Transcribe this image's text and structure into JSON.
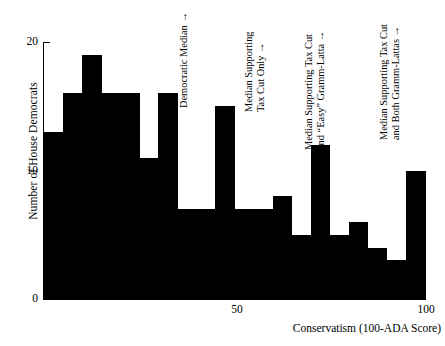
{
  "chart_data": {
    "type": "bar",
    "title": "",
    "subtitle": "",
    "xlabel": "Conservatism (100-ADA Score)",
    "ylabel": "Number of House Democrats",
    "xlim": [
      0,
      100
    ],
    "ylim": [
      0,
      20
    ],
    "grid": false,
    "legend": "none",
    "bar_style": "histogram (adjacent bins, solid black)",
    "xticks": [
      {
        "value": 50,
        "label": "50"
      },
      {
        "value": 100,
        "label": "100"
      }
    ],
    "yticks": [
      {
        "value": 0,
        "label": "0"
      },
      {
        "value": 10,
        "label": "10"
      },
      {
        "value": 20,
        "label": "20"
      }
    ],
    "bin_width": 5,
    "categories": [
      "0-5",
      "5-10",
      "10-15",
      "15-20",
      "20-25",
      "25-30",
      "30-35",
      "35-40",
      "40-45",
      "45-50",
      "50-55",
      "55-60",
      "60-65",
      "65-70",
      "70-75",
      "75-80",
      "80-85",
      "85-90",
      "90-95",
      "95-100"
    ],
    "bin_starts": [
      0,
      5,
      10,
      15,
      20,
      25,
      30,
      35,
      40,
      45,
      50,
      55,
      60,
      65,
      70,
      75,
      80,
      85,
      90,
      95
    ],
    "values": [
      13,
      16,
      19,
      16,
      16,
      11,
      16,
      7,
      7,
      15,
      7,
      7,
      8,
      5,
      12,
      5,
      6,
      4,
      3,
      10
    ],
    "annotations": [
      {
        "name": "democratic-median",
        "lines": [
          "Democratic Median →"
        ],
        "x_value": 33,
        "arrow": "→"
      },
      {
        "name": "median-supporting-tax-cut-only",
        "lines": [
          "Median Supporting",
          "Tax Cut Only →"
        ],
        "x_value": 52,
        "arrow": "→"
      },
      {
        "name": "median-supporting-tax-cut-and-easy-gramm-latta",
        "lines": [
          "Median Supporting Tax Cut",
          "and “Easy” Gramm-Latta →"
        ],
        "x_value": 67,
        "arrow": "→"
      },
      {
        "name": "median-supporting-tax-cut-and-both-gramm-lattas",
        "lines": [
          "Median Supporting Tax Cut",
          "and Both Gramm-Lattas →"
        ],
        "x_value": 86,
        "arrow": "→"
      }
    ],
    "colors": {
      "bar": "#000000",
      "axis": "#000000",
      "background": "#ffffff",
      "text": "#000000"
    }
  }
}
